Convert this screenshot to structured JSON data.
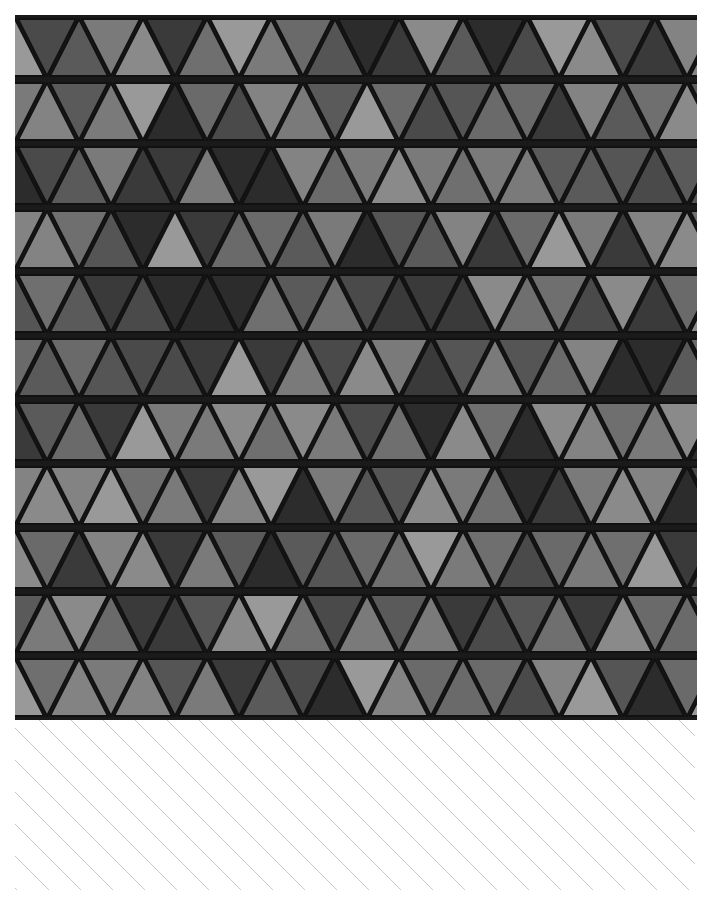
{
  "image": {
    "subject": "triangular wood tile mosaic, grayscale",
    "rows": 11,
    "triangle_width": 64,
    "row_height": 64,
    "grout_color": "#111111",
    "tones": [
      "#3a3a3a",
      "#4a4a4a",
      "#5a5a5a",
      "#6a6a6a",
      "#7a7a7a",
      "#8a8a8a",
      "#999999",
      "#2c2c2c",
      "#555555",
      "#6f6f6f",
      "#838383"
    ]
  },
  "hatch": {
    "line_color": "#c8c8c8",
    "spacing": 32,
    "angle_deg": 45
  }
}
